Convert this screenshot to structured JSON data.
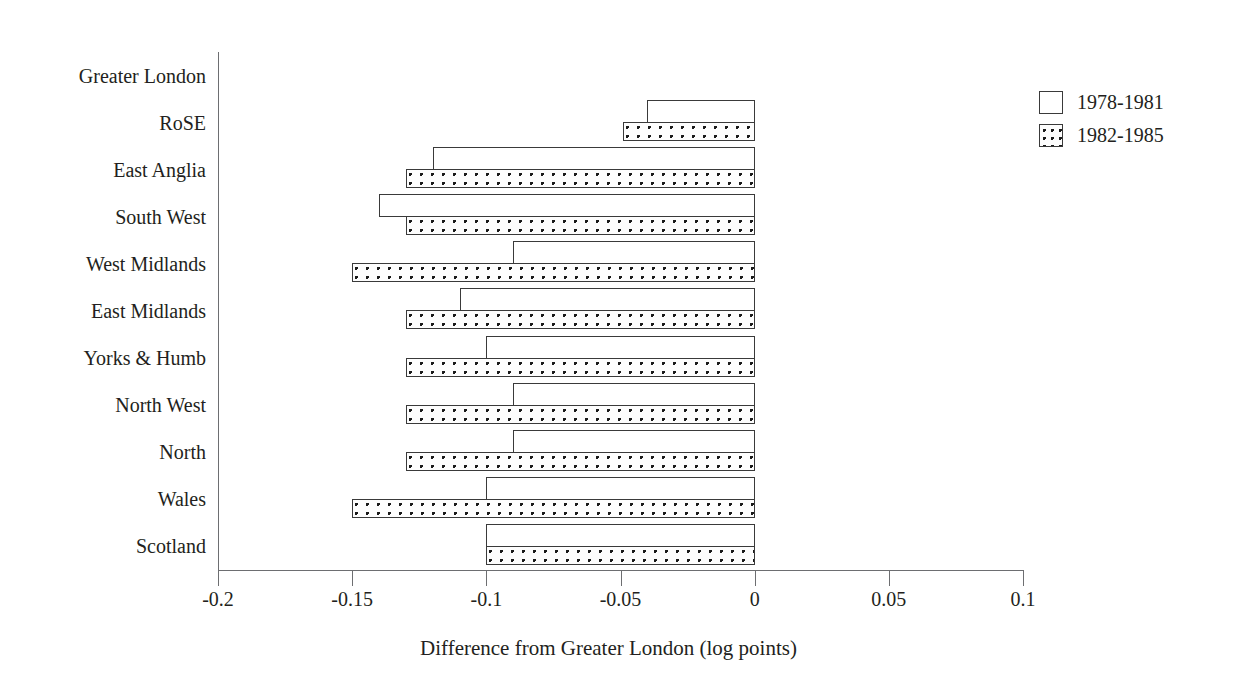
{
  "chart_data": {
    "type": "bar",
    "orientation": "horizontal",
    "title": "",
    "xlabel": "Difference from Greater London (log points)",
    "ylabel": "",
    "xlim": [
      -0.2,
      0.1
    ],
    "xticks": [
      "-0.2",
      "-0.15",
      "-0.1",
      "-0.05",
      "0",
      "0.05",
      "0.1"
    ],
    "xtick_values": [
      -0.2,
      -0.15,
      -0.1,
      -0.05,
      0,
      0.05,
      0.1
    ],
    "grid": false,
    "legend_position": "right",
    "categories": [
      "Greater London",
      "RoSE",
      "East Anglia",
      "South West",
      "West Midlands",
      "East Midlands",
      "Yorks & Humb",
      "North West",
      "North",
      "Wales",
      "Scotland"
    ],
    "series": [
      {
        "name": "1978-1981",
        "fill": "white",
        "values": [
          0,
          -0.04,
          -0.12,
          -0.14,
          -0.09,
          -0.11,
          -0.1,
          -0.09,
          -0.09,
          -0.1,
          -0.1
        ]
      },
      {
        "name": "1982-1985",
        "fill": "dotted",
        "values": [
          0,
          -0.049,
          -0.13,
          -0.13,
          -0.15,
          -0.13,
          -0.13,
          -0.13,
          -0.13,
          -0.15,
          -0.1
        ]
      }
    ]
  },
  "legend": {
    "items": [
      {
        "label": "1978-1981",
        "swatch": "empty-square"
      },
      {
        "label": "1982-1985",
        "swatch": "dotted-square"
      }
    ]
  },
  "axis": {
    "x_title": "Difference from Greater London (log points)"
  },
  "colors": {
    "bar_outline": "#3a3a3a",
    "dot": "#1a1a1a",
    "axis": "#6d6e71",
    "text": "#231f20",
    "background": "#ffffff"
  }
}
